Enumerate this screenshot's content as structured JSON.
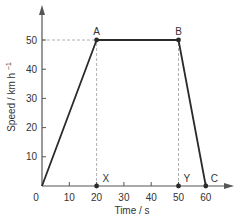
{
  "chart_data": {
    "type": "line",
    "title": "",
    "xlabel": "Time / s",
    "ylabel": "Speed / km h⁻¹",
    "xlim": [
      0,
      65
    ],
    "ylim": [
      0,
      58
    ],
    "x_ticks": [
      0,
      10,
      20,
      30,
      40,
      50,
      60
    ],
    "y_ticks": [
      10,
      20,
      30,
      40,
      50
    ],
    "x_tick_labels": [
      "0",
      "10",
      "20",
      "30",
      "40",
      "50",
      "60"
    ],
    "y_tick_labels": [
      "10",
      "20",
      "30",
      "40",
      "50"
    ],
    "grid": false,
    "legend": null,
    "series": [
      {
        "name": "speed",
        "x": [
          0,
          20,
          50,
          60
        ],
        "y": [
          0,
          50,
          50,
          0
        ]
      }
    ],
    "points": [
      {
        "label": "A",
        "x": 20,
        "y": 50
      },
      {
        "label": "B",
        "x": 50,
        "y": 50
      },
      {
        "label": "C",
        "x": 60,
        "y": 0
      },
      {
        "label": "X",
        "x": 20,
        "y": 0
      },
      {
        "label": "Y",
        "x": 50,
        "y": 0
      }
    ],
    "guides": [
      {
        "type": "horizontal-dashed",
        "from": [
          0,
          50
        ],
        "to": [
          20,
          50
        ]
      },
      {
        "type": "vertical-dashed",
        "from": [
          20,
          0
        ],
        "to": [
          20,
          50
        ]
      },
      {
        "type": "vertical-dashed",
        "from": [
          50,
          0
        ],
        "to": [
          50,
          50
        ]
      }
    ]
  },
  "colors": {
    "line": "#2a2a2a",
    "axis": "#555555",
    "guide": "#b0b0b0",
    "text": "#333333"
  }
}
